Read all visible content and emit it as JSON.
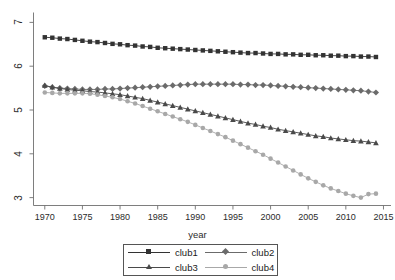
{
  "chart_data": {
    "type": "line",
    "title": "",
    "xlabel": "year",
    "ylabel": "",
    "xlim": [
      1968.5,
      2016
    ],
    "ylim": [
      2.82,
      7.18
    ],
    "xticks": [
      1970,
      1975,
      1980,
      1985,
      1990,
      1995,
      2000,
      2005,
      2010,
      2015
    ],
    "yticks": [
      3,
      4,
      5,
      6,
      7
    ],
    "grid": false,
    "legend_position": "bottom",
    "x": [
      1970,
      1971,
      1972,
      1973,
      1974,
      1975,
      1976,
      1977,
      1978,
      1979,
      1980,
      1981,
      1982,
      1983,
      1984,
      1985,
      1986,
      1987,
      1988,
      1989,
      1990,
      1991,
      1992,
      1993,
      1994,
      1995,
      1996,
      1997,
      1998,
      1999,
      2000,
      2001,
      2002,
      2003,
      2004,
      2005,
      2006,
      2007,
      2008,
      2009,
      2010,
      2011,
      2012,
      2013,
      2014
    ],
    "series": [
      {
        "name": "club1",
        "marker": "square",
        "color": "#333333",
        "values": [
          6.66,
          6.65,
          6.63,
          6.62,
          6.6,
          6.58,
          6.56,
          6.55,
          6.53,
          6.51,
          6.5,
          6.48,
          6.47,
          6.45,
          6.44,
          6.42,
          6.41,
          6.4,
          6.39,
          6.38,
          6.37,
          6.36,
          6.35,
          6.34,
          6.33,
          6.32,
          6.31,
          6.3,
          6.3,
          6.29,
          6.28,
          6.28,
          6.27,
          6.27,
          6.26,
          6.26,
          6.25,
          6.25,
          6.24,
          6.24,
          6.23,
          6.23,
          6.22,
          6.22,
          6.21
        ]
      },
      {
        "name": "club2",
        "marker": "diamond",
        "color": "#6b6b6b",
        "values": [
          5.55,
          5.52,
          5.5,
          5.49,
          5.48,
          5.47,
          5.47,
          5.47,
          5.48,
          5.48,
          5.49,
          5.5,
          5.51,
          5.52,
          5.53,
          5.54,
          5.55,
          5.56,
          5.57,
          5.58,
          5.59,
          5.59,
          5.59,
          5.59,
          5.59,
          5.59,
          5.58,
          5.58,
          5.57,
          5.57,
          5.56,
          5.55,
          5.54,
          5.53,
          5.52,
          5.51,
          5.5,
          5.49,
          5.48,
          5.47,
          5.46,
          5.45,
          5.44,
          5.42,
          5.4
        ]
      },
      {
        "name": "club3",
        "marker": "triangle",
        "color": "#4a4a4a",
        "values": [
          5.56,
          5.52,
          5.49,
          5.47,
          5.45,
          5.44,
          5.42,
          5.41,
          5.39,
          5.37,
          5.35,
          5.32,
          5.29,
          5.26,
          5.22,
          5.18,
          5.14,
          5.1,
          5.06,
          5.02,
          4.98,
          4.94,
          4.9,
          4.86,
          4.82,
          4.78,
          4.74,
          4.7,
          4.67,
          4.63,
          4.6,
          4.56,
          4.53,
          4.5,
          4.47,
          4.44,
          4.41,
          4.39,
          4.36,
          4.34,
          4.32,
          4.3,
          4.29,
          4.27,
          4.25
        ]
      },
      {
        "name": "club4",
        "marker": "circle",
        "color": "#a8a8a8",
        "values": [
          5.4,
          5.39,
          5.38,
          5.38,
          5.38,
          5.38,
          5.37,
          5.35,
          5.32,
          5.29,
          5.25,
          5.2,
          5.15,
          5.09,
          5.03,
          4.97,
          4.91,
          4.85,
          4.79,
          4.73,
          4.66,
          4.59,
          4.52,
          4.45,
          4.38,
          4.3,
          4.22,
          4.14,
          4.06,
          3.98,
          3.89,
          3.8,
          3.71,
          3.62,
          3.53,
          3.44,
          3.36,
          3.28,
          3.21,
          3.15,
          3.09,
          3.04,
          3.0,
          3.08,
          3.09
        ]
      }
    ]
  },
  "axis": {
    "x_title": "year",
    "x_tick_labels": [
      "1970",
      "1975",
      "1980",
      "1985",
      "1990",
      "1995",
      "2000",
      "2005",
      "2010",
      "2015"
    ],
    "y_tick_labels": [
      "3",
      "4",
      "5",
      "6",
      "7"
    ]
  },
  "legend": {
    "entries": [
      {
        "label": "club1"
      },
      {
        "label": "club2"
      },
      {
        "label": "club3"
      },
      {
        "label": "club4"
      }
    ]
  }
}
